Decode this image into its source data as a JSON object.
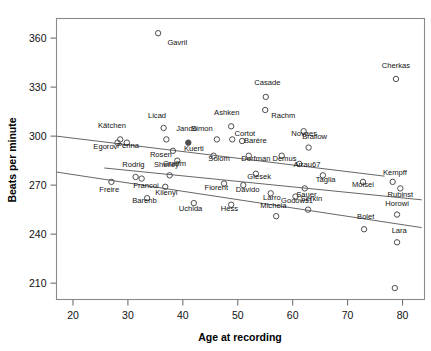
{
  "chart_data": {
    "type": "scatter",
    "title": "",
    "xlabel": "Age at recording",
    "ylabel": "Beats per minute",
    "xlim": [
      17,
      84
    ],
    "ylim": [
      200,
      372
    ],
    "xticks": [
      20,
      30,
      40,
      50,
      60,
      70,
      80
    ],
    "yticks": [
      210,
      240,
      270,
      300,
      330,
      360
    ],
    "grid": false,
    "legend": "none",
    "marker": "open-circle",
    "points": [
      {
        "label": "Gavril",
        "x": 35.5,
        "y": 363,
        "lx": 39.0,
        "ly": 356
      },
      {
        "label": "Cherkas",
        "x": 78.8,
        "y": 335,
        "lx": 78.8,
        "ly": 342
      },
      {
        "label": "Casade",
        "x": 55.1,
        "y": 324,
        "lx": 55.4,
        "ly": 331
      },
      {
        "label": "Rachm",
        "x": 55.0,
        "y": 316,
        "lx": 58.3,
        "ly": 311
      },
      {
        "label": "Ashken",
        "x": 48.8,
        "y": 306,
        "lx": 48.0,
        "ly": 313
      },
      {
        "label": "Licad",
        "x": 36.5,
        "y": 305,
        "lx": 35.3,
        "ly": 311
      },
      {
        "label": "Kätchen",
        "x": 28.6,
        "y": 298,
        "lx": 27.1,
        "ly": 305
      },
      {
        "label": "Jandó",
        "x": 37.0,
        "y": 298,
        "lx": 40.7,
        "ly": 303
      },
      {
        "label": "Novaes",
        "x": 62.0,
        "y": 303,
        "lx": 62.1,
        "ly": 300
      },
      {
        "label": "Cortot",
        "x": 49.0,
        "y": 298,
        "lx": 51.3,
        "ly": 300
      },
      {
        "label": "Simon",
        "x": 46.2,
        "y": 298,
        "lx": 43.5,
        "ly": 303
      },
      {
        "label": "Penna",
        "x": 29.8,
        "y": 296,
        "lx": 30.0,
        "ly": 293
      },
      {
        "label": "Egorov",
        "x": 28.1,
        "y": 296,
        "lx": 25.9,
        "ly": 292
      },
      {
        "label": "Barère",
        "x": 50.8,
        "y": 297,
        "lx": 53.2,
        "ly": 296
      },
      {
        "label": "Kuerti",
        "x": 41.0,
        "y": 296,
        "lx": 42.0,
        "ly": 291
      },
      {
        "label": "Brailow",
        "x": 62.9,
        "y": 293,
        "lx": 64.0,
        "ly": 298
      },
      {
        "label": "Rosen",
        "x": 38.2,
        "y": 291,
        "lx": 36.0,
        "ly": 287
      },
      {
        "label": "Solom",
        "x": 45.6,
        "y": 288,
        "lx": 46.6,
        "ly": 285
      },
      {
        "label": "Dorfman",
        "x": 52.0,
        "y": 288,
        "lx": 53.3,
        "ly": 285
      },
      {
        "label": "Demus",
        "x": 58.0,
        "y": 288,
        "lx": 58.5,
        "ly": 285
      },
      {
        "label": "Graffm",
        "x": 39.0,
        "y": 285,
        "lx": 38.5,
        "ly": 282
      },
      {
        "label": "Arrau67",
        "x": 61.2,
        "y": 283,
        "lx": 62.6,
        "ly": 281
      },
      {
        "label": "Shelley",
        "x": 37.6,
        "y": 276,
        "lx": 37.0,
        "ly": 281
      },
      {
        "label": "Rodrig",
        "x": 31.4,
        "y": 275,
        "lx": 31.0,
        "ly": 281
      },
      {
        "label": "Giesek",
        "x": 53.3,
        "y": 277,
        "lx": 53.9,
        "ly": 274
      },
      {
        "label": "Taglia",
        "x": 65.5,
        "y": 276,
        "lx": 66.0,
        "ly": 272
      },
      {
        "label": "Moisei",
        "x": 72.8,
        "y": 272,
        "lx": 72.8,
        "ly": 269
      },
      {
        "label": "Kempff",
        "x": 78.2,
        "y": 272,
        "lx": 78.6,
        "ly": 276
      },
      {
        "label": "Francoi",
        "x": 32.5,
        "y": 274,
        "lx": 33.3,
        "ly": 268
      },
      {
        "label": "Freire",
        "x": 27.0,
        "y": 272,
        "lx": 26.6,
        "ly": 266
      },
      {
        "label": "Fiorent",
        "x": 47.5,
        "y": 271,
        "lx": 46.1,
        "ly": 267
      },
      {
        "label": "Davido",
        "x": 51.0,
        "y": 270,
        "lx": 51.8,
        "ly": 266
      },
      {
        "label": "Kilenyi",
        "x": 36.8,
        "y": 269,
        "lx": 37.0,
        "ly": 264
      },
      {
        "label": "Sauer",
        "x": 62.2,
        "y": 268,
        "lx": 62.5,
        "ly": 263
      },
      {
        "label": "Rubinst",
        "x": 79.6,
        "y": 268,
        "lx": 79.6,
        "ly": 263
      },
      {
        "label": "Larro",
        "x": 56.0,
        "y": 265,
        "lx": 56.2,
        "ly": 261
      },
      {
        "label": "Barenb",
        "x": 33.5,
        "y": 262,
        "lx": 33.0,
        "ly": 259
      },
      {
        "label": "Godows1",
        "x": 60.5,
        "y": 263,
        "lx": 60.8,
        "ly": 259
      },
      {
        "label": "Uchida",
        "x": 42.0,
        "y": 259,
        "lx": 41.4,
        "ly": 254
      },
      {
        "label": "Hess",
        "x": 48.8,
        "y": 258,
        "lx": 48.5,
        "ly": 254
      },
      {
        "label": "Serkin",
        "x": 62.8,
        "y": 255,
        "lx": 63.4,
        "ly": 260
      },
      {
        "label": "Horowi",
        "x": 79.0,
        "y": 252,
        "lx": 79.0,
        "ly": 257
      },
      {
        "label": "Michela",
        "x": 57.0,
        "y": 251,
        "lx": 56.5,
        "ly": 256
      },
      {
        "label": "Bolet",
        "x": 73.0,
        "y": 243,
        "lx": 73.3,
        "ly": 249
      },
      {
        "label": "Lara",
        "x": 79.0,
        "y": 235,
        "lx": 79.4,
        "ly": 241
      },
      {
        "label": "Horowi2",
        "x": 78.6,
        "y": 207,
        "lx": 0,
        "ly": 0
      }
    ],
    "highlighted_point": {
      "label": "Kuerti",
      "x": 41.0,
      "y": 296,
      "style": "filled"
    },
    "fit_lines": [
      {
        "name": "upper-fit",
        "x1": 17.0,
        "y1": 300.0,
        "x2": 76.7,
        "y2": 275.5
      },
      {
        "name": "middle-fit",
        "x1": 25.7,
        "y1": 280.5,
        "x2": 83.5,
        "y2": 261.0
      },
      {
        "name": "lower-fit",
        "x1": 17.0,
        "y1": 278.0,
        "x2": 83.5,
        "y2": 244.0
      }
    ]
  },
  "axis": {
    "x_title": "Age at recording",
    "y_title": "Beats per minute",
    "x_tick_labels": [
      "20",
      "30",
      "40",
      "50",
      "60",
      "70",
      "80"
    ],
    "y_tick_labels": [
      "210",
      "240",
      "270",
      "300",
      "330",
      "360"
    ]
  }
}
